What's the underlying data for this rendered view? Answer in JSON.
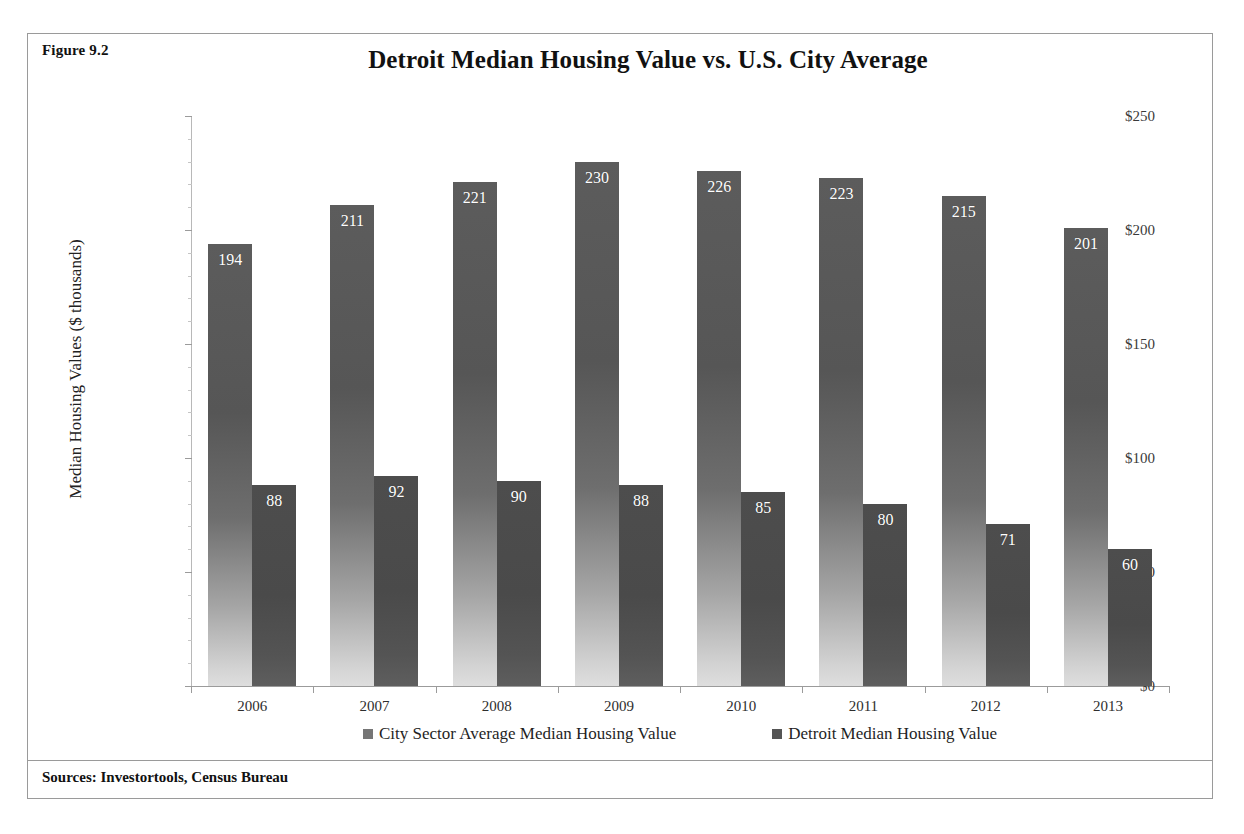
{
  "figure": {
    "label": "Figure 9.2",
    "source_note": "Sources: Investortools, Census Bureau"
  },
  "chart_data": {
    "type": "bar",
    "title": "Detroit Median Housing Value vs. U.S. City Average",
    "xlabel": "",
    "ylabel": "Median Housing Values ($ thousands)",
    "categories": [
      "2006",
      "2007",
      "2008",
      "2009",
      "2010",
      "2011",
      "2012",
      "2013"
    ],
    "series": [
      {
        "name": "City Sector Average Median Housing Value",
        "values": [
          194,
          211,
          221,
          230,
          226,
          223,
          215,
          201
        ],
        "color": "#5c5c5c"
      },
      {
        "name": "Detroit Median Housing Value",
        "values": [
          88,
          92,
          90,
          88,
          85,
          80,
          71,
          60
        ],
        "color": "#4d4d4d"
      }
    ],
    "ylim": [
      0,
      250
    ],
    "ytick_values": [
      0,
      50,
      100,
      150,
      200,
      250
    ],
    "ytick_labels": [
      "$0",
      "$50",
      "$100",
      "$150",
      "$200",
      "$250"
    ],
    "ytick_minor_step": 10,
    "grid": false,
    "legend_position": "bottom",
    "data_labels": true,
    "data_label_position": "inside-top"
  }
}
